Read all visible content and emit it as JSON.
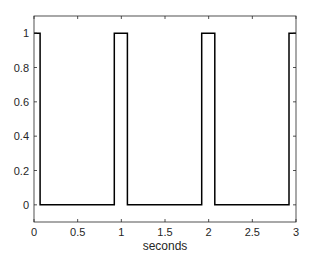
{
  "chart_data": {
    "type": "line",
    "title": "",
    "xlabel": "seconds",
    "ylabel": "",
    "xlim": [
      0,
      3
    ],
    "ylim": [
      -0.1,
      1.1
    ],
    "grid": false,
    "legend": null,
    "xticks": [
      0,
      0.5,
      1,
      1.5,
      2,
      2.5,
      3
    ],
    "xtick_labels": [
      "0",
      "0.5",
      "1",
      "1.5",
      "2",
      "2.5",
      "3"
    ],
    "yticks": [
      0,
      0.2,
      0.4,
      0.6,
      0.8,
      1
    ],
    "ytick_labels": [
      "0",
      "0.2",
      "0.4",
      "0.6",
      "0.8",
      "1"
    ],
    "series": [
      {
        "name": "pulse train",
        "color": "#000000",
        "x": [
          0,
          0.07,
          0.07,
          0.92,
          0.92,
          1.07,
          1.07,
          1.92,
          1.92,
          2.07,
          2.07,
          2.92,
          2.92,
          3.0
        ],
        "y": [
          1,
          1,
          0,
          0,
          1,
          1,
          0,
          0,
          1,
          1,
          0,
          0,
          1,
          1
        ]
      }
    ]
  },
  "colors": {
    "axis": "#262626",
    "line": "#000000",
    "background": "#ffffff"
  }
}
